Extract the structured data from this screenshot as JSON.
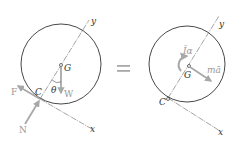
{
  "left_diagram": {
    "labels": {
      "y_axis": "y",
      "x_axis": "x",
      "center": "G",
      "contact": "C",
      "angle": "θ",
      "weight": "W",
      "friction": "F",
      "normal": "N"
    }
  },
  "equals_sign": "=",
  "right_diagram": {
    "labels": {
      "y_axis": "y",
      "x_axis": "x",
      "center": "G",
      "contact": "C",
      "moment": "Īα",
      "inertia_force": "mā"
    }
  },
  "colors": {
    "line": "#333333",
    "arrow": "#a8a8a8",
    "axis": "#666666"
  }
}
